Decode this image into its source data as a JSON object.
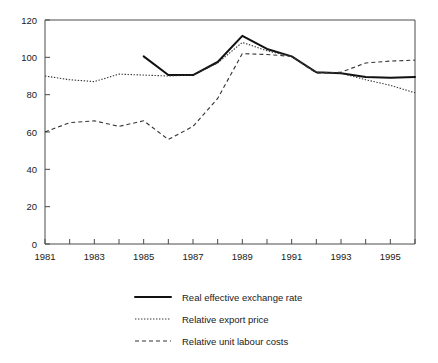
{
  "chart_data": {
    "type": "line",
    "title": "",
    "xlabel": "",
    "ylabel": "",
    "xlim": [
      1981,
      1996
    ],
    "ylim": [
      0,
      120
    ],
    "grid": false,
    "legend_position": "bottom",
    "x_tick_labels": [
      "1981",
      "1983",
      "1985",
      "1987",
      "1989",
      "1991",
      "1993",
      "1995"
    ],
    "x_tick_values": [
      1981,
      1983,
      1985,
      1987,
      1989,
      1991,
      1993,
      1995
    ],
    "x_minor_tick_values": [
      1982,
      1984,
      1986,
      1988,
      1990,
      1992,
      1994,
      1996
    ],
    "y_tick_labels": [
      "0",
      "20",
      "40",
      "60",
      "80",
      "100",
      "120"
    ],
    "y_tick_values": [
      0,
      20,
      40,
      60,
      80,
      100,
      120
    ],
    "x": [
      1981,
      1982,
      1983,
      1984,
      1985,
      1986,
      1987,
      1988,
      1989,
      1990,
      1991,
      1992,
      1993,
      1994,
      1995,
      1996
    ],
    "series": [
      {
        "name": "Real effective exchange rate",
        "style": "solid",
        "color": "#111111",
        "x": [
          1985,
          1986,
          1987,
          1988,
          1989,
          1990,
          1991,
          1992,
          1993,
          1994,
          1995,
          1996
        ],
        "values": [
          100.5,
          90.5,
          90.5,
          97.5,
          111.5,
          104.5,
          100.5,
          92.0,
          91.5,
          89.5,
          89.0,
          89.5
        ]
      },
      {
        "name": "Relative export price",
        "style": "dotted",
        "color": "#333333",
        "x": [
          1981,
          1982,
          1983,
          1984,
          1985,
          1986,
          1987,
          1988,
          1989,
          1990,
          1991,
          1992,
          1993,
          1994,
          1995,
          1996
        ],
        "values": [
          90.0,
          88.0,
          87.0,
          91.0,
          90.5,
          90.0,
          90.5,
          97.0,
          108.0,
          103.5,
          100.5,
          92.0,
          91.5,
          88.0,
          85.0,
          81.0
        ]
      },
      {
        "name": "Relative unit labour costs",
        "style": "dashed",
        "color": "#333333",
        "x": [
          1981,
          1982,
          1983,
          1984,
          1985,
          1986,
          1987,
          1988,
          1989,
          1990,
          1991,
          1992,
          1993,
          1994,
          1995,
          1996
        ],
        "values": [
          60.0,
          65.0,
          66.0,
          63.0,
          66.0,
          56.0,
          63.0,
          78.0,
          102.0,
          101.5,
          100.5,
          91.5,
          92.0,
          97.0,
          98.0,
          98.5
        ]
      }
    ]
  },
  "legend": {
    "items": [
      {
        "label": "Real effective exchange rate",
        "style": "solid"
      },
      {
        "label": "Relative export price",
        "style": "dotted"
      },
      {
        "label": "Relative unit labour costs",
        "style": "dashed"
      }
    ]
  }
}
